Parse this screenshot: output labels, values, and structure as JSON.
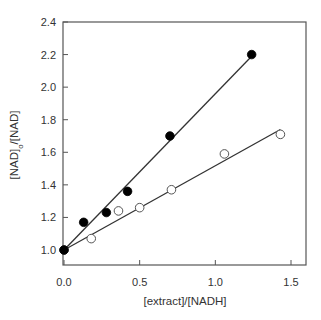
{
  "chart_data": {
    "type": "scatter",
    "title": "",
    "xlabel": "[extract]/[NADH]",
    "ylabel": "[NAD]o/[NAD]",
    "ylabel_parts": {
      "pre": "[NAD]",
      "sub": "o",
      "post": "/[NAD]"
    },
    "xlim": [
      0,
      1.6
    ],
    "ylim": [
      0.91,
      2.4
    ],
    "x_ticks": [
      0.0,
      0.5,
      1.0,
      1.5
    ],
    "x_tick_labels": [
      "0.0",
      "0.5",
      "1.0",
      "1.5"
    ],
    "y_ticks": [
      1.0,
      1.2,
      1.4,
      1.6,
      1.8,
      2.0,
      2.2,
      2.4
    ],
    "y_tick_labels": [
      "1.0",
      "1.2",
      "1.4",
      "1.6",
      "1.8",
      "2.0",
      "2.2",
      "2.4"
    ],
    "grid": false,
    "legend": null,
    "series": [
      {
        "name": "filled circles",
        "marker": "filled-circle",
        "color": "#000000",
        "points": [
          [
            0.0,
            1.0
          ],
          [
            0.13,
            1.17
          ],
          [
            0.28,
            1.23
          ],
          [
            0.42,
            1.36
          ],
          [
            0.7,
            1.7
          ],
          [
            1.24,
            2.2
          ]
        ],
        "fit_line": {
          "x0": 0.0,
          "y0": 1.0,
          "x1": 1.24,
          "y1": 2.19,
          "slope": 0.96
        }
      },
      {
        "name": "open circles",
        "marker": "open-circle",
        "color": "#000000",
        "points": [
          [
            0.0,
            1.0
          ],
          [
            0.18,
            1.07
          ],
          [
            0.36,
            1.24
          ],
          [
            0.5,
            1.26
          ],
          [
            0.71,
            1.37
          ],
          [
            1.06,
            1.59
          ],
          [
            1.43,
            1.71
          ]
        ],
        "fit_line": {
          "x0": 0.0,
          "y0": 1.0,
          "x1": 1.43,
          "y1": 1.74,
          "slope": 0.52
        }
      }
    ]
  },
  "colors": {
    "axis": "#555555",
    "line": "#333333",
    "marker": "#000000",
    "text": "#333333"
  }
}
